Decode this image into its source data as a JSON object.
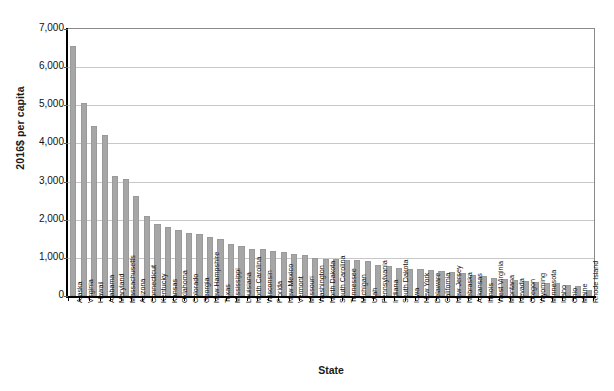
{
  "chart_data": {
    "type": "bar",
    "title": "",
    "subtitle": "",
    "xlabel": "State",
    "ylabel": "2016$ per capita",
    "ylim": [
      0,
      7000
    ],
    "ytick_labels": [
      "7,000",
      "6,000",
      "5,000",
      "4,000",
      "3,000",
      "2,000",
      "1,000",
      "0"
    ],
    "ytick_values": [
      7000,
      6000,
      5000,
      4000,
      3000,
      2000,
      1000,
      0
    ],
    "grid": true,
    "legend": "none",
    "bar_color": "#a6a6a6",
    "categories": [
      "Alaska",
      "Virginia",
      "Hawaii",
      "Alabama",
      "Maryland",
      "Massachusetts",
      "Arizona",
      "Connecticut",
      "Kentucky",
      "Kansas",
      "Oklahoma",
      "Colorado",
      "Georgia",
      "New Hampshire",
      "Texas",
      "Mississippi",
      "Louisiana",
      "North Carolina",
      "Wisconsin",
      "Florida",
      "New Mexico",
      "Vermont",
      "Missouri",
      "Washington",
      "North Dakota",
      "South Carolina",
      "Tennessee",
      "Michigan",
      "Utah",
      "Pennsylvania",
      "Indiana",
      "South Dakota",
      "Iowa",
      "New York",
      "Delaware",
      "California",
      "New Jersey",
      "Nebraska",
      "Arkansas",
      "Illinois",
      "West Virginia",
      "Montana",
      "Nevada",
      "Oregon",
      "Wyoming",
      "Minnesota",
      "Idaho",
      "Ohio",
      "Maine",
      "Rhode Island"
    ],
    "values": [
      6550,
      5050,
      4470,
      4230,
      3140,
      3080,
      2610,
      2090,
      1880,
      1800,
      1720,
      1640,
      1620,
      1540,
      1500,
      1360,
      1300,
      1240,
      1230,
      1180,
      1160,
      1100,
      1080,
      1000,
      980,
      970,
      950,
      940,
      930,
      820,
      790,
      740,
      720,
      700,
      680,
      660,
      640,
      600,
      560,
      530,
      460,
      440,
      420,
      400,
      380,
      350,
      330,
      300,
      250,
      150
    ]
  }
}
